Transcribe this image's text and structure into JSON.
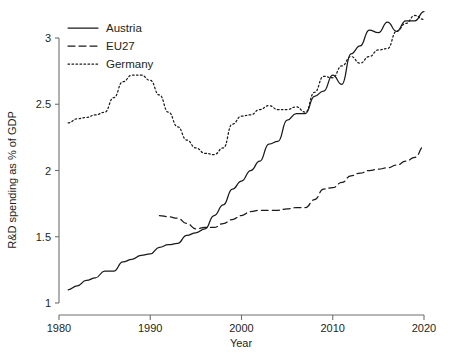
{
  "chart_data": {
    "type": "line",
    "title": "",
    "xlabel": "Year",
    "ylabel": "R&D spending as % of GDP",
    "xlim": [
      1980,
      2020
    ],
    "ylim": [
      1,
      3.2
    ],
    "xticks": [
      1980,
      1990,
      2000,
      2010,
      2020
    ],
    "xtick_labels": [
      "1980",
      "1990",
      "2000",
      "2010",
      "2020"
    ],
    "yticks": [
      1,
      1.5,
      2,
      2.5,
      3
    ],
    "ytick_labels": [
      "1",
      "1.5",
      "2",
      "2.5",
      "3"
    ],
    "grid": false,
    "legend_position": "top-left",
    "series": [
      {
        "name": "Austria",
        "style": "solid",
        "color": "#1a1a1a",
        "x": [
          1981,
          1982,
          1983,
          1984,
          1985,
          1986,
          1987,
          1988,
          1989,
          1990,
          1991,
          1992,
          1993,
          1994,
          1995,
          1996,
          1997,
          1998,
          1999,
          2000,
          2001,
          2002,
          2003,
          2004,
          2005,
          2006,
          2007,
          2008,
          2009,
          2010,
          2011,
          2012,
          2013,
          2014,
          2015,
          2016,
          2017,
          2018,
          2019,
          2020
        ],
        "values": [
          1.1,
          1.13,
          1.17,
          1.19,
          1.24,
          1.24,
          1.31,
          1.33,
          1.36,
          1.37,
          1.42,
          1.44,
          1.45,
          1.51,
          1.53,
          1.56,
          1.66,
          1.74,
          1.86,
          1.92,
          2.0,
          2.07,
          2.2,
          2.22,
          2.38,
          2.43,
          2.43,
          2.56,
          2.6,
          2.72,
          2.65,
          2.88,
          2.94,
          3.06,
          3.04,
          3.12,
          3.05,
          3.13,
          3.13,
          3.2
        ]
      },
      {
        "name": "EU27",
        "style": "dashed",
        "color": "#1a1a1a",
        "x": [
          1991,
          1992,
          1993,
          1994,
          1995,
          1996,
          1997,
          1998,
          1999,
          2000,
          2001,
          2002,
          2003,
          2004,
          2005,
          2006,
          2007,
          2008,
          2009,
          2010,
          2011,
          2012,
          2013,
          2014,
          2015,
          2016,
          2017,
          2018,
          2019,
          2020
        ],
        "values": [
          1.66,
          1.65,
          1.64,
          1.6,
          1.56,
          1.57,
          1.57,
          1.6,
          1.63,
          1.66,
          1.69,
          1.7,
          1.7,
          1.7,
          1.71,
          1.72,
          1.72,
          1.78,
          1.86,
          1.87,
          1.91,
          1.96,
          1.98,
          2.0,
          2.01,
          2.02,
          2.04,
          2.07,
          2.1,
          2.18
        ]
      },
      {
        "name": "Germany",
        "style": "dotted",
        "color": "#1a1a1a",
        "x": [
          1981,
          1982,
          1983,
          1984,
          1985,
          1986,
          1987,
          1988,
          1989,
          1990,
          1991,
          1992,
          1993,
          1994,
          1995,
          1996,
          1997,
          1998,
          1999,
          2000,
          2001,
          2002,
          2003,
          2004,
          2005,
          2006,
          2007,
          2008,
          2009,
          2010,
          2011,
          2012,
          2013,
          2014,
          2015,
          2016,
          2017,
          2018,
          2019,
          2020
        ],
        "values": [
          2.36,
          2.39,
          2.4,
          2.42,
          2.44,
          2.55,
          2.67,
          2.72,
          2.72,
          2.68,
          2.57,
          2.44,
          2.33,
          2.23,
          2.17,
          2.13,
          2.12,
          2.17,
          2.35,
          2.41,
          2.42,
          2.46,
          2.49,
          2.46,
          2.46,
          2.48,
          2.44,
          2.59,
          2.71,
          2.7,
          2.79,
          2.86,
          2.81,
          2.86,
          2.91,
          2.92,
          3.05,
          3.11,
          3.17,
          3.14
        ]
      }
    ]
  },
  "legend": {
    "items": [
      {
        "label": "Austria",
        "style": "solid"
      },
      {
        "label": "EU27",
        "style": "dashed"
      },
      {
        "label": "Germany",
        "style": "dotted"
      }
    ]
  },
  "axes": {
    "x_title": "Year",
    "y_title": "R&D spending as % of GDP"
  }
}
